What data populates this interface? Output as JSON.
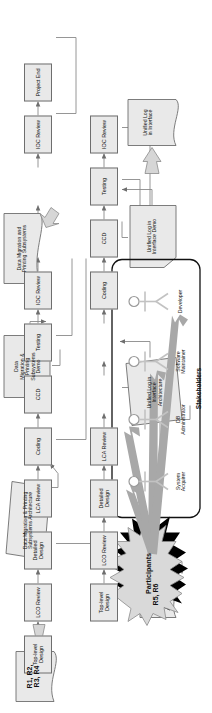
{
  "diagram": {
    "orientation": "rotated-90-ccw",
    "colors": {
      "process_fill": "#e9e9e9",
      "process_stroke": "#6e6e6e",
      "doc_fill": "#e9e9e9",
      "doc_stroke": "#6e6e6e",
      "arrow_gray": "#a8a8a8",
      "line": "#8a8a8a",
      "burst_fill": "#d9d9d9",
      "burst_shadow": "#000000",
      "actor": "#c8c8c8",
      "text": "#111111"
    },
    "rows": [
      {
        "name": "row-top",
        "processes": [
          "Top-level Design",
          "LCO Review",
          "Detailed Design",
          "LCA Review",
          "Coding",
          "CCD",
          "Testing",
          "IOC Review",
          "Project End"
        ]
      },
      {
        "name": "row-middle",
        "processes": [
          "Top-level Design",
          "LCO Review",
          "Detailed Design",
          "LCA Review",
          "Coding",
          "CCD",
          "Testing",
          "IOC Review"
        ]
      }
    ],
    "documents": [
      {
        "id": "doc-r1r4",
        "label": "R1, R2,\nR3, R4",
        "shape": "document"
      },
      {
        "id": "doc-dmps-arch",
        "label": "Data Migration & Printing\nSubsystems Architecture",
        "shape": "parallelogram"
      },
      {
        "id": "doc-dmps-demo",
        "label": "Data\nMigration &\nPrinting\nSubsystems\nDemo",
        "shape": "flag"
      },
      {
        "id": "doc-dmps",
        "label": "Data Migration and\nPrinting Subsystems",
        "shape": "document"
      },
      {
        "id": "doc-r5r6",
        "label": "R5, R6",
        "shape": "document"
      },
      {
        "id": "doc-uli-arch",
        "label": "Unified Log in\nInterface\nArchitecture",
        "shape": "parallelogram"
      },
      {
        "id": "doc-uli-demo",
        "label": "Unified Log in\nInterface Demo",
        "shape": "flag"
      },
      {
        "id": "doc-uli",
        "label": "Unified Log\nin Interface",
        "shape": "document"
      }
    ],
    "burst": {
      "label": "Participants"
    },
    "stakeholders": {
      "title": "Stakeholders",
      "actors": [
        "System\nAcquirer",
        "DB\nAdministrator",
        "Software\nMaintainer",
        "Developer"
      ]
    }
  }
}
